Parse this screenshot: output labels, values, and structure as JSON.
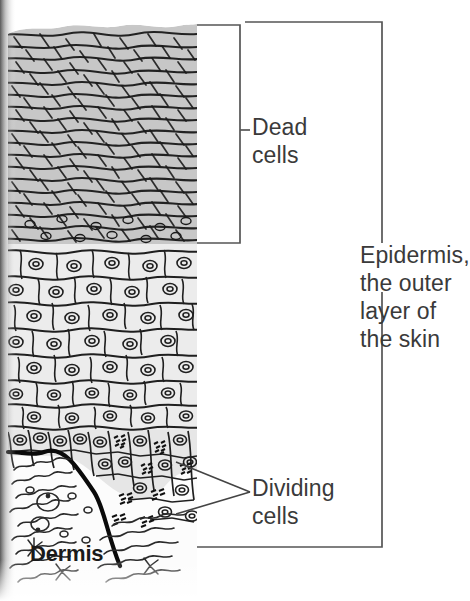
{
  "figure": {
    "type": "labeled-biological-diagram"
  },
  "labels": {
    "dead_cells": "Dead\ncells",
    "epidermis": "Epidermis,\nthe outer\nlayer of\nthe skin",
    "dividing_cells": "Dividing\ncells",
    "dermis": "Dermis"
  },
  "colors": {
    "text": "#3a3a3a",
    "dermis_text": "#1a1a1a",
    "bracket": "#555555",
    "dead_layer_fill": "#c8c8c8",
    "living_layer_fill": "#ececec",
    "basal_layer_fill": "#e2e2e2",
    "dermis_fill": "#fbfbfb",
    "ink": "#111111",
    "background": "#ffffff"
  },
  "layers": [
    {
      "name": "dead-cell-layer",
      "y_top": 22,
      "y_bottom": 245
    },
    {
      "name": "living-cell-layer",
      "y_top": 245,
      "y_bottom": 430
    },
    {
      "name": "basal-dividing-layer",
      "y_top": 430,
      "y_bottom": 540
    },
    {
      "name": "dermis-layer",
      "y_top": 455,
      "y_bottom": 595
    }
  ],
  "brackets": [
    {
      "name": "dead-cells-bracket",
      "x": 240,
      "y_top": 25,
      "y_bottom": 243,
      "tick_y": 130
    },
    {
      "name": "epidermis-bracket",
      "x": 382,
      "y_top": 22,
      "y_bottom": 547,
      "tick_y": 285
    }
  ],
  "leaders": {
    "dividing_cells": {
      "apex_x": 250,
      "apex_y": 492
    }
  }
}
